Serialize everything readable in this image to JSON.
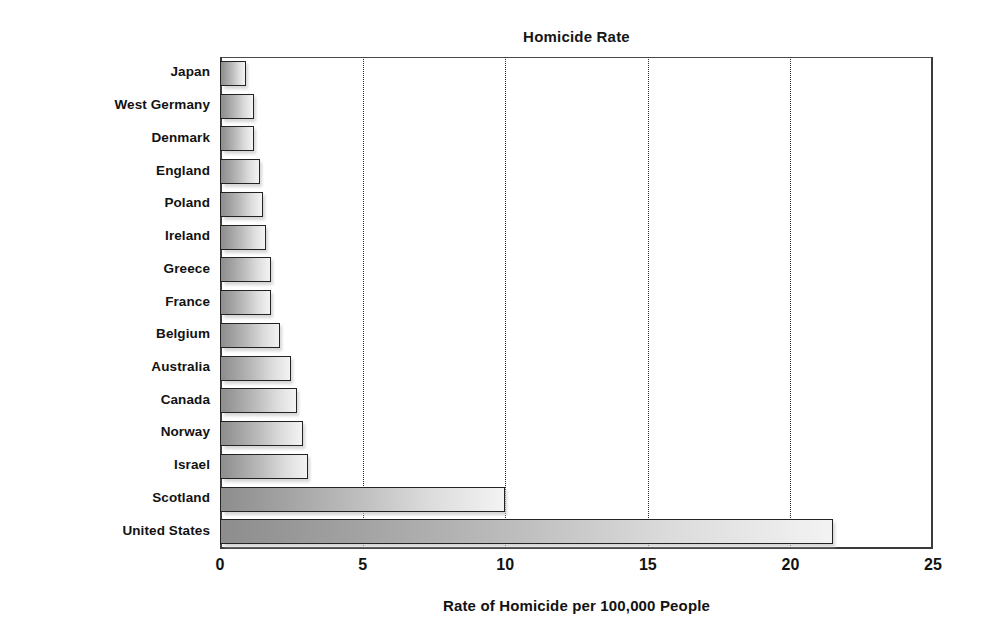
{
  "chart_data": {
    "type": "bar",
    "orientation": "horizontal",
    "title": "Homicide Rate",
    "xlabel": "Rate of Homicide per 100,000 People",
    "ylabel": "",
    "xlim": [
      0,
      25
    ],
    "xticks": [
      "0",
      "5",
      "10",
      "15",
      "20",
      "25"
    ],
    "xtick_values": [
      0,
      5,
      10,
      15,
      20,
      25
    ],
    "gridlines": [
      5,
      10,
      15,
      20
    ],
    "grid": "vertical-dotted",
    "legend": "none",
    "categories": [
      "Japan",
      "West Germany",
      "Denmark",
      "England",
      "Poland",
      "Ireland",
      "Greece",
      "France",
      "Belgium",
      "Australia",
      "Canada",
      "Norway",
      "Israel",
      "Scotland",
      "United States"
    ],
    "values": [
      0.9,
      1.2,
      1.2,
      1.4,
      1.5,
      1.6,
      1.8,
      1.8,
      2.1,
      2.5,
      2.7,
      2.9,
      3.1,
      10.0,
      21.5
    ]
  },
  "style": {
    "bar_fill_start": "#8d8d8d",
    "bar_fill_end": "#f3f3f3",
    "bar_border": "#232323",
    "axis_color": "#3b3b3b",
    "grid_color": "#2b2b2b",
    "text_color": "#121212",
    "background": "#ffffff"
  }
}
